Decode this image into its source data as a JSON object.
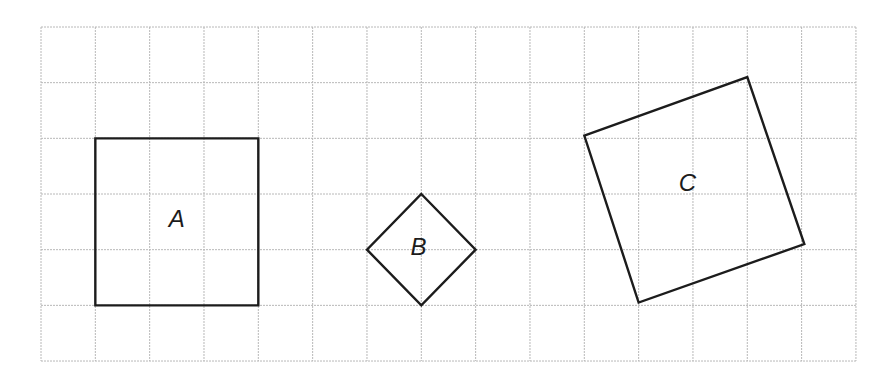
{
  "figure": {
    "grid": {
      "columns": 15,
      "rows": 6,
      "origin_px": [
        41,
        27
      ],
      "cell_w_px": 54.33,
      "cell_h_px": 55.67,
      "line_color": "#b8b8b8"
    },
    "shapes": [
      {
        "label": "A",
        "type": "square",
        "vertices_grid": [
          [
            1,
            2
          ],
          [
            4,
            2
          ],
          [
            4,
            5
          ],
          [
            1,
            5
          ]
        ],
        "side_units": 3,
        "label_pos_grid": [
          2.5,
          3.6
        ]
      },
      {
        "label": "B",
        "type": "square-rotated-45",
        "vertices_grid": [
          [
            7,
            3
          ],
          [
            8,
            4
          ],
          [
            7,
            5
          ],
          [
            6,
            4
          ]
        ],
        "side_units": "√2",
        "label_pos_grid": [
          6.95,
          4.1
        ]
      },
      {
        "label": "C",
        "type": "square-tilted",
        "vertices_grid": [
          [
            10,
            1.95
          ],
          [
            13,
            0.9
          ],
          [
            14.05,
            3.9
          ],
          [
            11,
            4.95
          ]
        ],
        "side_units": "√10",
        "label_pos_grid": [
          11.9,
          2.95
        ]
      }
    ],
    "stroke_color": "#1c1c1c"
  }
}
